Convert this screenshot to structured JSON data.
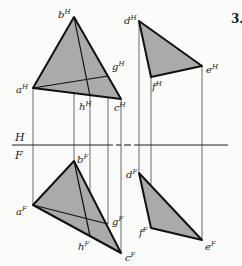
{
  "problem_number": "3.",
  "planes": {
    "top": "H",
    "front": "F"
  },
  "colors": {
    "fill": "#aaaaaa",
    "line": "#111111",
    "background": "#fbfbf9"
  },
  "points": {
    "aH": {
      "name": "a",
      "view": "H",
      "label_sup": "H"
    },
    "bH": {
      "name": "b",
      "view": "H",
      "label_sup": "H"
    },
    "cH": {
      "name": "c",
      "view": "H",
      "label_sup": "H"
    },
    "gH": {
      "name": "g",
      "view": "H",
      "label_sup": "H"
    },
    "hH": {
      "name": "h",
      "view": "H",
      "label_sup": "H"
    },
    "dH": {
      "name": "d",
      "view": "H",
      "label_sup": "H"
    },
    "eH": {
      "name": "e",
      "view": "H",
      "label_sup": "H"
    },
    "fH": {
      "name": "f",
      "view": "H",
      "label_sup": "H"
    },
    "aF": {
      "name": "a",
      "view": "F",
      "label_sup": "F"
    },
    "bF": {
      "name": "b",
      "view": "F",
      "label_sup": "F"
    },
    "cF": {
      "name": "c",
      "view": "F",
      "label_sup": "F"
    },
    "gF": {
      "name": "g",
      "view": "F",
      "label_sup": "F"
    },
    "hF": {
      "name": "h",
      "view": "F",
      "label_sup": "F"
    },
    "dF": {
      "name": "d",
      "view": "F",
      "label_sup": "F"
    },
    "eF": {
      "name": "e",
      "view": "F",
      "label_sup": "F"
    },
    "fF": {
      "name": "f",
      "view": "F",
      "label_sup": "F"
    }
  },
  "shapes": {
    "triangle_abc": "Plane ABC (triangle) shown in top (H) and front (F) views with lines a-g and b-h",
    "triangle_def": "Plane DEF (triangle) shown in top (H) and front (F) views"
  }
}
